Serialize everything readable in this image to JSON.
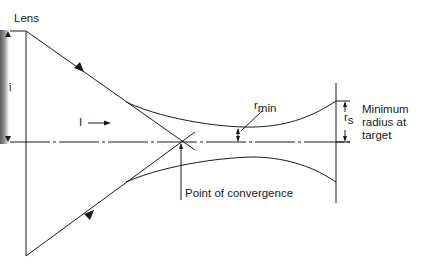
{
  "diagram": {
    "type": "beam-convergence",
    "colors": {
      "line": "#1a1a1a",
      "background": "#ffffff"
    },
    "labels": {
      "lens": "Lens",
      "aperture": "i",
      "current": "I",
      "r_min_base": "r",
      "r_min_sub": "min",
      "r_s_base": "r",
      "r_s_sub": "s",
      "target_note_line1": "Minimum",
      "target_note_line2": "radius at",
      "target_note_line3": "target",
      "convergence": "Point of convergence"
    }
  }
}
